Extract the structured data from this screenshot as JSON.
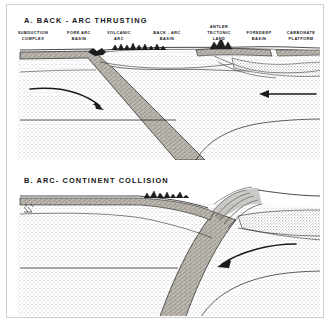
{
  "figure": {
    "kind": "geologic-cross-section",
    "panel_count": 2,
    "background_color": "#ffffff",
    "line_color": "#1a1a1a",
    "stipple_color": "#8a8a8a",
    "crust_fill_color": "#b9b4ac"
  },
  "panels": [
    {
      "id": "A",
      "title": "A. BACK - ARC THRUSTING",
      "features": [
        {
          "id": "subduction-complex",
          "line1": "SUBDUCTION",
          "line2": "COMPLEX",
          "x": 33,
          "y": 30
        },
        {
          "id": "fore-arc-basin",
          "line1": "FORE ARC",
          "line2": "BASIN",
          "x": 79,
          "y": 30
        },
        {
          "id": "volcanic-arc",
          "line1": "VOLCANIC",
          "line2": "ARC",
          "x": 118,
          "y": 30
        },
        {
          "id": "back-arc-basin",
          "line1": "BACK - ARC",
          "line2": "BASIN",
          "x": 166,
          "y": 30
        },
        {
          "id": "antler-tectonic-land",
          "line1": "ANTLER",
          "line2": "TECTONIC",
          "line3": "LAND",
          "x": 219,
          "y": 25
        },
        {
          "id": "foredeep-basin",
          "line1": "FOREDEEP",
          "line2": "BASIN",
          "x": 258,
          "y": 30
        },
        {
          "id": "carbonate-platform",
          "line1": "CARBONATE",
          "line2": "PLATFORM",
          "x": 297,
          "y": 30
        }
      ],
      "arrows": [
        {
          "id": "slab-descent-arrow",
          "direction": "curving-down-right",
          "meaning": "subducting slab motion"
        },
        {
          "id": "convergence-arrow",
          "direction": "left",
          "meaning": "continental plate convergence"
        }
      ]
    },
    {
      "id": "B",
      "title": "B. ARC- CONTINENT COLLISION",
      "features": [],
      "arrows": [
        {
          "id": "collision-convergence-arrow",
          "direction": "curving-down-left",
          "meaning": "arc driven toward continent"
        }
      ]
    }
  ]
}
